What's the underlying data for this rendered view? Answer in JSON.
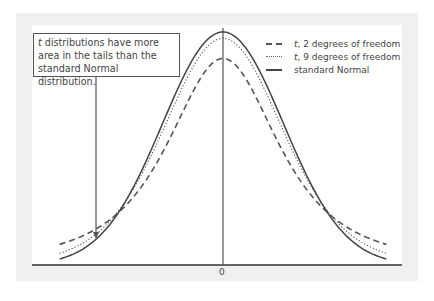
{
  "chart_data": {
    "type": "line",
    "title": "",
    "xlabel": "",
    "ylabel": "",
    "xlim": [
      -2.7,
      2.7
    ],
    "x_ticks": [
      {
        "value": 0,
        "label": "0"
      }
    ],
    "grid": false,
    "legend_position": "top-right",
    "series": [
      {
        "name": "t, 2 degrees of freedom",
        "italic_prefix": "t",
        "suffix": ", 2 degrees of freedom",
        "distribution": "t",
        "df": 2,
        "style": "dashed",
        "color": "#555555"
      },
      {
        "name": "t, 9 degrees of freedom",
        "italic_prefix": "t",
        "suffix": ", 9 degrees of freedom",
        "distribution": "t",
        "df": 9,
        "style": "dotted",
        "color": "#555555"
      },
      {
        "name": "standard Normal",
        "italic_prefix": "",
        "suffix": "standard Normal",
        "distribution": "normal",
        "df": null,
        "style": "solid",
        "color": "#444444"
      }
    ],
    "annotation": {
      "italic_prefix": "t",
      "line1_rest": " distributions have more",
      "line2": "area in the tails than the",
      "line3": "standard Normal distribution.",
      "points_to": "left tail of t, 2 degrees of freedom"
    }
  },
  "colors": {
    "panel": "#f0f0f0",
    "plot_bg": "#ffffff",
    "ink": "#444444"
  }
}
